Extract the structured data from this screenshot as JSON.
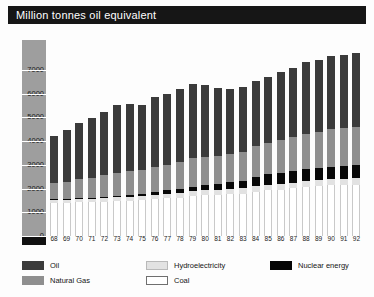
{
  "header": {
    "title": "Million tonnes oil equivalent"
  },
  "legend": {
    "items": [
      {
        "label": "Oil",
        "key": "oil",
        "color": "#3b3b3b",
        "col": 0,
        "row": 0
      },
      {
        "label": "Natural Gas",
        "key": "gas",
        "color": "#8f8f8f",
        "col": 0,
        "row": 1
      },
      {
        "label": "Hydroelectricity",
        "key": "hyd",
        "color": "#e2e2e2",
        "col": 1,
        "row": 0
      },
      {
        "label": "Coal",
        "key": "coal",
        "color": "#ffffff",
        "col": 1,
        "row": 1
      },
      {
        "label": "Nuclear energy",
        "key": "nuc",
        "color": "#050505",
        "col": 2,
        "row": 0
      }
    ]
  },
  "chart_data": {
    "type": "bar",
    "stacked": true,
    "title": "Million tonnes oil equivalent",
    "xlabel": "",
    "ylabel": "Million tonnes oil equivalent",
    "ylim": [
      0,
      7500
    ],
    "yticks": [
      0,
      1000,
      2000,
      3000,
      4000,
      5000,
      6000,
      7000
    ],
    "ytick_labels": [
      "0",
      "1000",
      "2000",
      "3000",
      "4000",
      "5000",
      "6000",
      "7000"
    ],
    "grid": true,
    "legend_position": "bottom",
    "categories": [
      "68",
      "69",
      "70",
      "71",
      "72",
      "73",
      "74",
      "75",
      "76",
      "77",
      "78",
      "79",
      "80",
      "81",
      "82",
      "83",
      "84",
      "85",
      "86",
      "87",
      "88",
      "89",
      "90",
      "91",
      "92"
    ],
    "stack_order_bottom_to_top": [
      "Coal",
      "Hydroelectricity",
      "Nuclear energy",
      "Natural Gas",
      "Oil"
    ],
    "series": [
      {
        "name": "Coal",
        "key": "coal",
        "color": "#ffffff",
        "values": [
          1400,
          1400,
          1420,
          1420,
          1440,
          1470,
          1490,
          1510,
          1560,
          1600,
          1620,
          1700,
          1740,
          1740,
          1760,
          1790,
          1870,
          1930,
          1960,
          2010,
          2080,
          2100,
          2140,
          2150,
          2170
        ]
      },
      {
        "name": "Hydroelectricity",
        "key": "hyd",
        "color": "#e2e2e2",
        "values": [
          120,
          130,
          135,
          140,
          150,
          155,
          165,
          170,
          175,
          180,
          190,
          195,
          200,
          205,
          210,
          215,
          225,
          230,
          235,
          240,
          245,
          250,
          255,
          260,
          265
        ]
      },
      {
        "name": "Nuclear energy",
        "key": "nuc",
        "color": "#050505",
        "values": [
          20,
          25,
          30,
          40,
          55,
          70,
          90,
          110,
          130,
          150,
          175,
          190,
          210,
          240,
          290,
          330,
          400,
          440,
          470,
          490,
          510,
          520,
          530,
          540,
          550
        ]
      },
      {
        "name": "Natural Gas",
        "key": "gas",
        "color": "#8f8f8f",
        "values": [
          680,
          740,
          800,
          860,
          910,
          960,
          980,
          1000,
          1060,
          1080,
          1120,
          1190,
          1200,
          1190,
          1180,
          1220,
          1290,
          1340,
          1370,
          1420,
          1480,
          1520,
          1570,
          1610,
          1620
        ]
      },
      {
        "name": "Oil",
        "key": "oil",
        "color": "#3b3b3b",
        "values": [
          1980,
          2180,
          2390,
          2530,
          2680,
          2870,
          2830,
          2750,
          2930,
          2970,
          3080,
          3150,
          3000,
          2870,
          2760,
          2730,
          2760,
          2760,
          2880,
          2930,
          3020,
          3040,
          3080,
          3090,
          3100
        ]
      }
    ],
    "totals": [
      4200,
      4475,
      4775,
      4990,
      5235,
      5525,
      5555,
      5540,
      5855,
      5980,
      6185,
      6425,
      6350,
      6245,
      6200,
      6285,
      6545,
      6700,
      6915,
      7090,
      7335,
      7430,
      7575,
      7650,
      7705
    ]
  }
}
